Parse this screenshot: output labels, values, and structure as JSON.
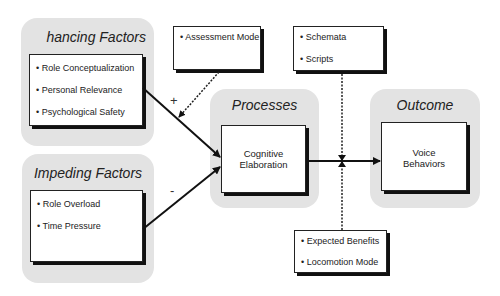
{
  "enhancing": {
    "title": "hancing Factors",
    "items": [
      "• Role Conceptualization",
      "• Personal Relevance",
      "• Psychological Safety"
    ]
  },
  "impeding": {
    "title": "Impeding Factors",
    "items": [
      "• Role Overload",
      "• Time Pressure"
    ]
  },
  "moderator_top_left": {
    "items": [
      "• Assessment Mode"
    ]
  },
  "moderator_top_right": {
    "items": [
      "• Schemata",
      "• Scripts"
    ]
  },
  "moderator_bottom": {
    "items": [
      "• Expected Benefits",
      "• Locomotion Mode"
    ]
  },
  "processes": {
    "title": "Processes",
    "line1": "Cognitive",
    "line2": "Elaboration"
  },
  "outcome": {
    "title": "Outcome",
    "line1": "Voice",
    "line2": "Behaviors"
  },
  "signs": {
    "plus": "+",
    "minus": "-"
  }
}
